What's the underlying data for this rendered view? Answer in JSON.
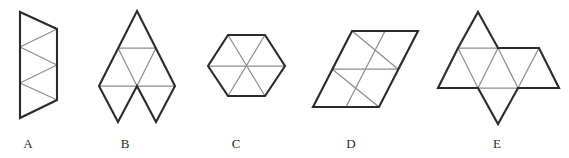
{
  "figure": {
    "background_color": "#ffffff",
    "outline_color": "#2b2b2b",
    "inner_line_color": "#8d8d8d",
    "labels": [
      {
        "id": "A",
        "text": "A"
      },
      {
        "id": "B",
        "text": "B"
      },
      {
        "id": "C",
        "text": "C"
      },
      {
        "id": "D",
        "text": "D"
      },
      {
        "id": "E",
        "text": "E"
      }
    ],
    "shapes": [
      {
        "id": "A",
        "name": "triangle-strip",
        "description": "Vertical strip of four alternating triangles between two parallel vertical edges",
        "triangle_count": 4,
        "outline": "20,12 57,29 20,47 57,65 20,83 57,100 20,118",
        "outline_closing_edges": [
          "20,12 20,118",
          "57,29 57,100"
        ],
        "inner_lines": [
          "20,47 57,29",
          "20,83 57,65",
          "20,47 57,65",
          "20,83 57,100"
        ]
      },
      {
        "id": "B",
        "name": "large-triangle-with-two-pendant-triangles",
        "description": "Subdivided large upward triangle with two downward triangles hanging below",
        "triangle_count": 6,
        "outline": "137,11 175,86 137,86 156,122 137,86 99,86 118,122 137,86 99,86 137,11",
        "inner_lines": [
          "118,48 156,48",
          "99,86 137,86",
          "137,86 175,86",
          "118,48 137,86",
          "156,48 137,86"
        ]
      },
      {
        "id": "C",
        "name": "hexagon-six-triangles",
        "description": "Regular hexagon divided by three main diagonals into six triangles",
        "triangle_count": 6,
        "outline": "228,35 265,35 285,66 265,96 228,96 208,66 228,35",
        "inner_lines": [
          "208,66 285,66",
          "228,35 265,96",
          "265,35 228,96"
        ]
      },
      {
        "id": "D",
        "name": "rhombus-eight-triangles",
        "description": "Parallelogram (rhombus) ruled into a 2x2 grid of rhombi forming eight triangles",
        "triangle_count": 8,
        "outline": "352,31 418,31 379,107 313,107 352,31",
        "inner_lines": [
          "332,69 398,69",
          "385,31 346,107",
          "352,31 398,69",
          "332,69 379,107",
          "352,31 313,107",
          "418,31 379,107"
        ]
      },
      {
        "id": "E",
        "name": "triangle-row-with-top-and-bottom-triangles",
        "description": "Row of triangles with one triangle above on the left and one below in the centre",
        "triangle_count": 8,
        "outline": "478,12 498,48 539,48 559,88 518,88 498,124 478,88 458,88 458,88 438,88 458,48 498,48 478,12",
        "inner_lines": [
          "458,48 539,48",
          "438,88 559,88",
          "478,12 458,48",
          "498,48 478,88",
          "458,48 478,88",
          "539,48 518,88"
        ]
      }
    ]
  }
}
